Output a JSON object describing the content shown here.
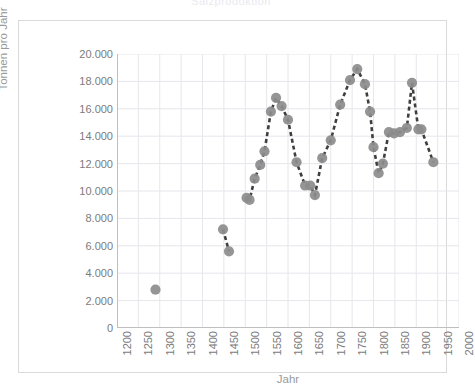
{
  "figure": {
    "title_remnant": "Salzproduktion",
    "frame_color": "#d9d9d9",
    "grid_color": "#e6e6ec",
    "marker_color": "#8c8c8c",
    "line_color": "#3f3f3f",
    "tick_text_color": "#7b7b7b",
    "axis_title_color": "#9a9a9a"
  },
  "chart_data": {
    "type": "scatter",
    "title": "",
    "xlabel": "Jahr",
    "ylabel": "Tonnen pro Jahr",
    "xlim": [
      1200,
      2000
    ],
    "ylim": [
      0,
      20000
    ],
    "xticks": [
      1200,
      1250,
      1300,
      1350,
      1400,
      1450,
      1500,
      1550,
      1600,
      1650,
      1700,
      1750,
      1800,
      1850,
      1900,
      1950,
      2000
    ],
    "xtick_labels": [
      "1200",
      "1250",
      "1300",
      "1350",
      "1400",
      "1450",
      "1500",
      "1550",
      "1600",
      "1650",
      "1700",
      "1750",
      "1800",
      "1850",
      "1900",
      "1950",
      "2000"
    ],
    "yticks": [
      0,
      2000,
      4000,
      6000,
      8000,
      10000,
      12000,
      14000,
      16000,
      18000,
      20000
    ],
    "ytick_labels": [
      "0",
      "2.000",
      "4.000",
      "6.000",
      "8.000",
      "10.000",
      "12.000",
      "14.000",
      "16.000",
      "18.000",
      "20.000"
    ],
    "grid": true,
    "legend": false,
    "marker_size": 8,
    "line_style": "dashed",
    "series": [
      {
        "name": "Tonnen pro Jahr",
        "connected": false,
        "x": [
          1290
        ],
        "y": [
          2800
        ]
      },
      {
        "name": "Tonnen pro Jahr",
        "connected": true,
        "x": [
          1448,
          1462
        ],
        "y": [
          7200,
          5600
        ]
      },
      {
        "name": "Tonnen pro Jahr",
        "connected": true,
        "x": [
          1503,
          1510,
          1522,
          1535,
          1545,
          1560,
          1572,
          1585,
          1600,
          1620,
          1640,
          1652,
          1663,
          1680,
          1700,
          1722,
          1745,
          1762,
          1780,
          1792,
          1800,
          1812,
          1822,
          1836,
          1848,
          1862,
          1878,
          1890,
          1905,
          1912,
          1940
        ],
        "y": [
          9500,
          9350,
          10900,
          11900,
          12900,
          15800,
          16800,
          16200,
          15200,
          12100,
          10400,
          10400,
          9700,
          12400,
          13700,
          16300,
          18100,
          18900,
          17800,
          15800,
          13200,
          11300,
          12000,
          14300,
          14200,
          14300,
          14600,
          17900,
          14500,
          14500,
          12100
        ]
      }
    ],
    "points_flat": [
      {
        "year": 1290,
        "tons": 2800
      },
      {
        "year": 1448,
        "tons": 7200
      },
      {
        "year": 1462,
        "tons": 5600
      },
      {
        "year": 1503,
        "tons": 9500
      },
      {
        "year": 1510,
        "tons": 9350
      },
      {
        "year": 1522,
        "tons": 10900
      },
      {
        "year": 1535,
        "tons": 11900
      },
      {
        "year": 1545,
        "tons": 12900
      },
      {
        "year": 1560,
        "tons": 15800
      },
      {
        "year": 1572,
        "tons": 16800
      },
      {
        "year": 1585,
        "tons": 16200
      },
      {
        "year": 1600,
        "tons": 15200
      },
      {
        "year": 1620,
        "tons": 12100
      },
      {
        "year": 1640,
        "tons": 10400
      },
      {
        "year": 1652,
        "tons": 10400
      },
      {
        "year": 1663,
        "tons": 9700
      },
      {
        "year": 1680,
        "tons": 12400
      },
      {
        "year": 1700,
        "tons": 13700
      },
      {
        "year": 1722,
        "tons": 16300
      },
      {
        "year": 1745,
        "tons": 18100
      },
      {
        "year": 1762,
        "tons": 18900
      },
      {
        "year": 1780,
        "tons": 17800
      },
      {
        "year": 1792,
        "tons": 15800
      },
      {
        "year": 1800,
        "tons": 13200
      },
      {
        "year": 1812,
        "tons": 11300
      },
      {
        "year": 1822,
        "tons": 12000
      },
      {
        "year": 1836,
        "tons": 14300
      },
      {
        "year": 1848,
        "tons": 14200
      },
      {
        "year": 1862,
        "tons": 14300
      },
      {
        "year": 1878,
        "tons": 14600
      },
      {
        "year": 1890,
        "tons": 17900
      },
      {
        "year": 1905,
        "tons": 14500
      },
      {
        "year": 1940,
        "tons": 12100
      }
    ]
  }
}
